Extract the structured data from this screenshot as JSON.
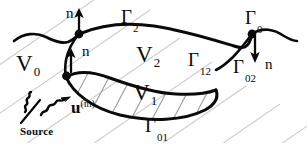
{
  "figure": {
    "width": 307,
    "height": 150,
    "background_color": "#ffffff",
    "ink_color": "#0a0a0a",
    "hatch_color": "#c8c8c8",
    "type": "geometry-diagram"
  },
  "labels": {
    "v0": {
      "base": "V",
      "sub": "0"
    },
    "v1": {
      "base": "V",
      "sub": "1"
    },
    "v2": {
      "base": "V",
      "sub": "2"
    },
    "gamma_0": {
      "base": "Γ",
      "sub": "0"
    },
    "gamma_2": {
      "base": "Γ",
      "sub": "2"
    },
    "gamma_12": {
      "base": "Γ",
      "sub": "12"
    },
    "gamma_01": {
      "base": "Γ",
      "sub": "01"
    },
    "gamma_02": {
      "base": "Γ",
      "sub": "02"
    },
    "normal_top": "n",
    "normal_mid": "n",
    "normal_right": "n",
    "incident_field": {
      "base": "u",
      "sup": "(in)"
    },
    "source": "Source"
  },
  "annotations": {
    "junction_dots": 3,
    "normal_arrows": 3,
    "source_waves": 2
  }
}
